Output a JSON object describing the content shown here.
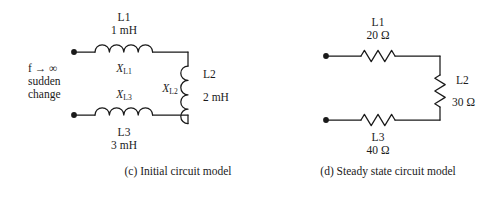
{
  "figure": {
    "kind": "circuit-diagram-pair",
    "stroke_color": "#1a1a1a",
    "background_color": "#ffffff"
  },
  "panel_c": {
    "caption": "(c) Initial circuit model",
    "condition": {
      "line1": "f → ∞",
      "f_symbol": "f",
      "arrow": "→",
      "infinity": "∞",
      "line2": "sudden",
      "line3": "change"
    },
    "components": {
      "l1": {
        "name": "L1",
        "value": "1 mH",
        "reactance_symbol": "X",
        "reactance_subscript": "L1",
        "type": "inductor",
        "orientation": "horizontal",
        "coils": 4
      },
      "l2": {
        "name": "L2",
        "value": "2 mH",
        "reactance_symbol": "X",
        "reactance_subscript": "L2",
        "type": "inductor",
        "orientation": "vertical",
        "coils": 4
      },
      "l3": {
        "name": "L3",
        "value": "3 mH",
        "reactance_symbol": "X",
        "reactance_subscript": "L3",
        "type": "inductor",
        "orientation": "horizontal",
        "coils": 4
      }
    },
    "terminals": [
      "top-left-node",
      "bottom-left-node"
    ]
  },
  "panel_d": {
    "caption": "(d) Steady state circuit model",
    "components": {
      "l1": {
        "name": "L1",
        "value": "20 Ω",
        "type": "resistor",
        "orientation": "horizontal"
      },
      "l2": {
        "name": "L2",
        "value": "30 Ω",
        "type": "resistor",
        "orientation": "vertical"
      },
      "l3": {
        "name": "L3",
        "value": "40 Ω",
        "type": "resistor",
        "orientation": "horizontal"
      }
    },
    "terminals": [
      "top-left-node",
      "bottom-left-node"
    ]
  }
}
